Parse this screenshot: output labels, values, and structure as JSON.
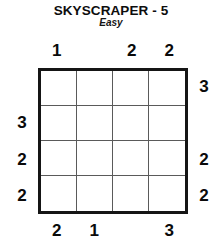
{
  "header": {
    "title": "SKYSCRAPER - 5",
    "difficulty": "Easy"
  },
  "puzzle": {
    "type": "skyscraper",
    "size": 4,
    "clues": {
      "top": [
        "1",
        "",
        "2",
        "2"
      ],
      "bottom": [
        "2",
        "1",
        "",
        "3"
      ],
      "left": [
        "",
        "3",
        "2",
        "2"
      ],
      "right": [
        "3",
        "",
        "2",
        "2"
      ]
    },
    "grid": [
      [
        "",
        "",
        "",
        ""
      ],
      [
        "",
        "",
        "",
        ""
      ],
      [
        "",
        "",
        "",
        ""
      ],
      [
        "",
        "",
        "",
        ""
      ]
    ],
    "colors": {
      "border": "#151515",
      "gridline": "#5a5a5a",
      "text": "#0a0a0a",
      "background": "#ffffff"
    }
  }
}
